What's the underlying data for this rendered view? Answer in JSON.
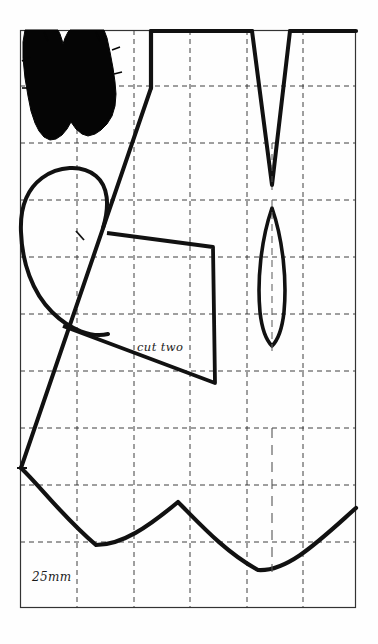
{
  "document": {
    "type": "sewing-pattern-sheet",
    "description": "Scale-grid sewing pattern diagram with pattern pieces"
  },
  "labels": {
    "cut_two": "cut two",
    "scale": "25mm"
  },
  "grid": {
    "frame": {
      "x": 20,
      "y": 30,
      "width": 336,
      "height": 578
    },
    "cell_size_px": 56.5,
    "vertical_lines": [
      77,
      134,
      190,
      247,
      303
    ],
    "horizontal_lines": [
      86,
      143,
      200,
      257,
      314,
      371,
      428,
      485,
      542
    ],
    "line_style": "dashed",
    "line_color": "#2b2b2b",
    "frame_color": "#333333"
  },
  "pieces": [
    {
      "name": "filled-scalloped-piece",
      "fill": "#000000",
      "position": "top-left"
    },
    {
      "name": "dart-notch-piece",
      "description": "V-shaped dart cut from top edge",
      "position": "top-right"
    },
    {
      "name": "lens-piece",
      "description": "pointed oval / leaf shaped piece with centre fold line",
      "position": "middle-right"
    },
    {
      "name": "oval-outline-piece",
      "description": "large rounded outline",
      "position": "middle-left"
    },
    {
      "name": "cut-two-quadrilateral",
      "description": "four sided pattern piece labelled cut two",
      "position": "centre"
    },
    {
      "name": "wavy-hem-curve",
      "description": "undulating hem line across the lower sheet",
      "position": "bottom"
    }
  ],
  "colors": {
    "ink": "#1a1a1a",
    "paper": "#fefefe",
    "grid": "#2b2b2b"
  }
}
